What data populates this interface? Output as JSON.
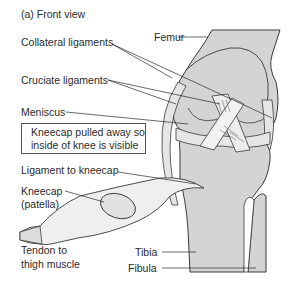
{
  "diagram": {
    "title": "(a) Front view",
    "colors": {
      "bone_fill": "#d4d4d4",
      "ligament_fill": "#e6e6e6",
      "outline": "#3a3a3a",
      "background": "#ffffff"
    },
    "labels": {
      "femur": "Femur",
      "collateral_ligaments": "Collateral ligaments",
      "cruciate_ligaments": "Cruciate ligaments",
      "meniscus": "Meniscus",
      "ligament_to_kneecap": "Ligament to kneecap",
      "kneecap_line1": "Kneecap",
      "kneecap_line2": "(patella)",
      "tendon_line1": "Tendon to",
      "tendon_line2": "thigh muscle",
      "tibia": "Tibia",
      "fibula": "Fibula"
    },
    "note": {
      "line1": "Kneecap pulled away so",
      "line2": "inside of knee is visible"
    }
  }
}
